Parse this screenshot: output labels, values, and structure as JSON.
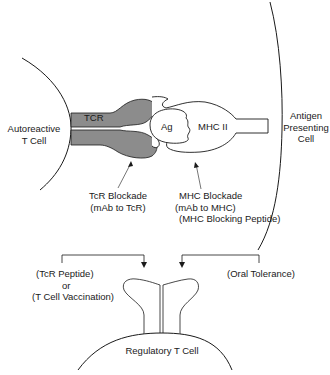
{
  "diagram": {
    "colors": {
      "stroke": "#1a1a1a",
      "tcr_fill": "#8c8c8c",
      "background": "#ffffff"
    },
    "nodes": {
      "autoreactive_t_cell": {
        "line1": "Autoreactive",
        "line2": "T Cell"
      },
      "antigen_presenting_cell": {
        "line1": "Antigen",
        "line2": "Presenting",
        "line3": "Cell"
      },
      "tcr": {
        "label": "TCR"
      },
      "antigen": {
        "label": "Ag"
      },
      "mhc_ii": {
        "label": "MHC II"
      },
      "regulatory_t_cell": {
        "label": "Regulatory T Cell"
      }
    },
    "annotations": {
      "tcr_blockade": {
        "line1": "TcR Blockade",
        "line2": "(mAb to TcR)"
      },
      "mhc_blockade": {
        "line1": "MHC Blockade",
        "line2": "(mAb to MHC)",
        "line3": "(MHC Blocking Peptide)"
      },
      "tcr_peptide": {
        "line1": "(TcR Peptide)",
        "line2": "or",
        "line3": "(T Cell Vaccination)"
      },
      "oral_tolerance": {
        "label": "(Oral Tolerance)"
      }
    }
  }
}
